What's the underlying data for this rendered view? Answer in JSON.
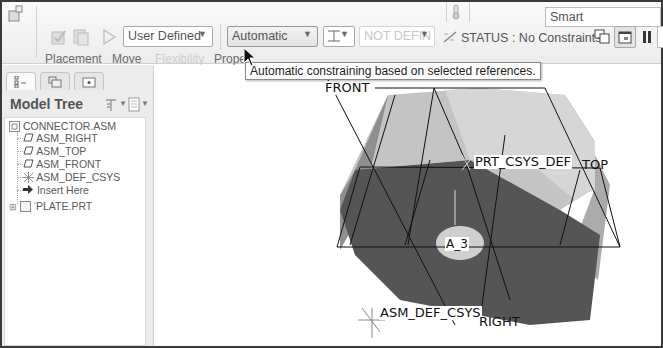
{
  "ribbon": {
    "type_dropdown": "User Defined",
    "constraint_dropdown": "Automatic",
    "offset_dropdown": "NOT DEFIN",
    "status_text": "STATUS : No Constraints",
    "search_value": "Smart",
    "tabs": [
      {
        "label": "Placement",
        "enabled": true
      },
      {
        "label": "Move",
        "enabled": true
      },
      {
        "label": "Flexibility",
        "enabled": false
      },
      {
        "label": "Prope",
        "enabled": true
      }
    ],
    "tooltip": "Automatic constraining based on selected references."
  },
  "model_tree": {
    "title": "Model Tree",
    "items": [
      {
        "label": "CONNECTOR.ASM",
        "icon": "assembly-icon"
      },
      {
        "label": "ASM_RIGHT",
        "icon": "datum-plane-icon"
      },
      {
        "label": "ASM_TOP",
        "icon": "datum-plane-icon"
      },
      {
        "label": "ASM_FRONT",
        "icon": "datum-plane-icon"
      },
      {
        "label": "ASM_DEF_CSYS",
        "icon": "csys-icon"
      },
      {
        "label": "Insert Here",
        "icon": "insert-arrow-icon"
      },
      {
        "label": "PLATE.PRT",
        "icon": "part-icon"
      }
    ]
  },
  "viewport": {
    "labels": {
      "front": "FRONT",
      "top": "TOP",
      "right": "RIGHT",
      "prt_csys": "PRT_CSYS_DEF",
      "axis": "A_3",
      "asm_csys": "ASM_DEF_CSYS"
    }
  }
}
